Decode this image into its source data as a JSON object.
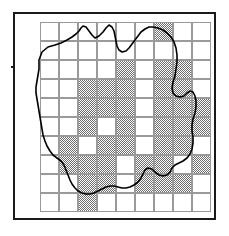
{
  "figure": {
    "title": "",
    "caption": "",
    "width": 229,
    "height": 236,
    "background_color": "#ffffff"
  },
  "map": {
    "type": "species-distribution-atlas-map",
    "frame": {
      "x": 13,
      "y": 12,
      "width": 203,
      "height": 208,
      "border_color": "#1a1a1a",
      "border_width": 2
    },
    "grid": {
      "label": "10 km square grid",
      "cell_size_px": 19,
      "origin_x_px": 25,
      "origin_y_px": 8,
      "columns": 9,
      "rows": 10,
      "line_color": "#9a9a9a",
      "line_width_px": 0.6
    },
    "symbology": {
      "occupied_label": "Recorded",
      "occupied_fill": "#6d6d6d",
      "occupied_pattern": "50% dither stipple",
      "absent_label": "Not recorded",
      "absent_fill": "#ffffff",
      "boundary_label": "County boundary",
      "boundary_color": "#000000"
    },
    "occupied_cells": [
      [
        6,
        0
      ],
      [
        4,
        2
      ],
      [
        6,
        2
      ],
      [
        7,
        2
      ],
      [
        2,
        3
      ],
      [
        3,
        3
      ],
      [
        4,
        3
      ],
      [
        6,
        3
      ],
      [
        7,
        3
      ],
      [
        2,
        4
      ],
      [
        3,
        4
      ],
      [
        4,
        4
      ],
      [
        6,
        4
      ],
      [
        7,
        4
      ],
      [
        8,
        4
      ],
      [
        2,
        5
      ],
      [
        4,
        5
      ],
      [
        6,
        5
      ],
      [
        7,
        5
      ],
      [
        8,
        5
      ],
      [
        1,
        6
      ],
      [
        3,
        6
      ],
      [
        4,
        6
      ],
      [
        6,
        6
      ],
      [
        7,
        6
      ],
      [
        1,
        7
      ],
      [
        2,
        7
      ],
      [
        3,
        7
      ],
      [
        5,
        7
      ],
      [
        6,
        7
      ],
      [
        8,
        7
      ],
      [
        2,
        8
      ],
      [
        3,
        8
      ],
      [
        5,
        8
      ],
      [
        6,
        8
      ],
      [
        7,
        8
      ],
      [
        2,
        9
      ]
    ],
    "boundary_path": "M 24 46 L 27 38 L 33 33 L 40 31 L 46 29 L 52 26 L 57 23 L 61 20 L 64 17 L 66 14 L 68 12 L 71 13 L 74 17 L 77 21 L 80 24 L 84 22 L 88 18 L 91 14 L 94 11 L 97 13 L 99 17 L 100 22 L 101 27 L 102 32 L 104 36 L 107 38 L 111 37 L 114 34 L 117 30 L 120 26 L 123 22 L 126 18 L 130 15 L 134 13 L 138 13 L 143 14 L 148 16 L 152 19 L 156 23 L 159 28 L 161 34 L 162 41 L 162 48 L 161 55 L 160 62 L 158 68 L 157 74 L 158 79 L 161 82 L 165 83 L 169 82 L 172 79 L 175 77 L 178 78 L 180 82 L 181 87 L 181 93 L 180 99 L 178 105 L 177 111 L 177 117 L 178 123 L 178 129 L 177 135 L 175 140 L 172 144 L 168 147 L 164 149 L 160 151 L 157 154 L 155 158 L 152 161 L 148 162 L 144 161 L 140 158 L 137 155 L 133 154 L 130 156 L 128 160 L 126 164 L 123 168 L 119 171 L 115 173 L 111 174 L 107 174 L 103 173 L 99 172 L 95 172 L 91 173 L 87 175 L 83 177 L 79 179 L 75 180 L 71 180 L 67 179 L 63 177 L 60 174 L 57 170 L 55 166 L 53 161 L 51 156 L 49 151 L 46 147 L 42 144 L 38 141 L 35 137 L 32 132 L 30 127 L 28 121 L 27 115 L 26 109 L 25 103 L 24 97 L 23 91 L 22 85 L 21 79 L 21 73 L 22 67 L 23 61 L 24 55 Z"
  }
}
